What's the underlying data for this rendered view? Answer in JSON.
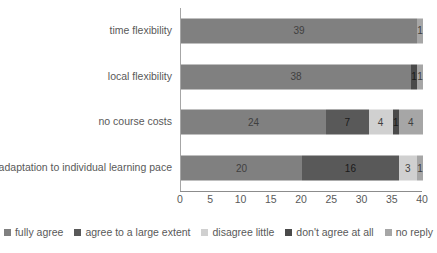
{
  "chart_data": {
    "type": "bar",
    "orientation": "horizontal",
    "stacked": true,
    "title": "",
    "subtitle": "",
    "xlabel": "",
    "ylabel": "",
    "xlim": [
      0,
      40
    ],
    "xticks": [
      0,
      5,
      10,
      15,
      20,
      25,
      30,
      35,
      40
    ],
    "xtick_labels": [
      "0",
      "5",
      "10",
      "15",
      "20",
      "25",
      "30",
      "35",
      "40"
    ],
    "grid": false,
    "legend_position": "bottom",
    "categories": [
      "time flexibility",
      "local flexibility",
      "no course costs",
      "adaptation to individual learning pace"
    ],
    "series": [
      {
        "name": "fully agree",
        "color": "#808080",
        "values": [
          39,
          38,
          24,
          20
        ]
      },
      {
        "name": "agree to a large extent",
        "color": "#595959",
        "values": [
          0,
          0,
          7,
          16
        ]
      },
      {
        "name": "disagree little",
        "color": "#d0d0d0",
        "values": [
          0,
          0,
          4,
          3
        ]
      },
      {
        "name": "don't agree at all",
        "color": "#4a4a4a",
        "values": [
          0,
          1,
          1,
          0
        ]
      },
      {
        "name": "no reply",
        "color": "#a6a6a6",
        "values": [
          1,
          1,
          4,
          1
        ]
      }
    ],
    "data_labels": [
      [
        "39",
        "",
        "",
        "",
        "1"
      ],
      [
        "38",
        "",
        "",
        "1",
        "1"
      ],
      [
        "24",
        "7",
        "4",
        "1",
        "4"
      ],
      [
        "20",
        "16",
        "3",
        "",
        "1"
      ]
    ]
  },
  "legend": {
    "entries": [
      {
        "label": "fully agree",
        "color": "#808080"
      },
      {
        "label": "agree to a large extent",
        "color": "#595959"
      },
      {
        "label": "disagree little",
        "color": "#d0d0d0"
      },
      {
        "label": "don't agree at all",
        "color": "#4a4a4a"
      },
      {
        "label": "no reply",
        "color": "#a6a6a6"
      }
    ]
  }
}
